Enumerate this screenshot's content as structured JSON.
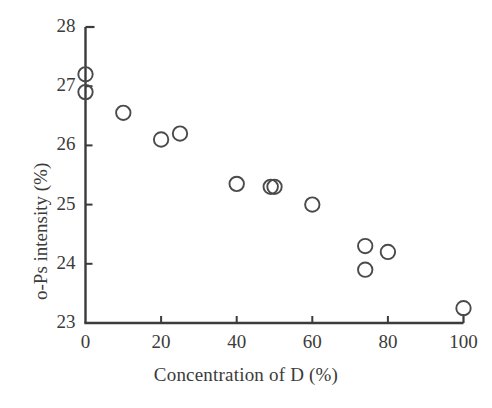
{
  "chart_data": {
    "type": "scatter",
    "title": "",
    "xlabel": "Concentration of D (%)",
    "ylabel": "o-Ps intensity (%)",
    "xlim": [
      0,
      100
    ],
    "ylim": [
      23,
      28
    ],
    "xticks": [
      0,
      20,
      40,
      60,
      80,
      100
    ],
    "xtick_labels": [
      "0",
      "20",
      "40",
      "60",
      "80",
      "100"
    ],
    "yticks": [
      23,
      24,
      25,
      26,
      27,
      28
    ],
    "ytick_labels": [
      "23",
      "24",
      "25",
      "26",
      "27",
      "28"
    ],
    "grid": false,
    "legend": null,
    "marker": "open-circle",
    "marker_color": "#4a4a4a",
    "points": [
      {
        "x": 0,
        "y": 27.2
      },
      {
        "x": 0,
        "y": 26.9
      },
      {
        "x": 10,
        "y": 26.55
      },
      {
        "x": 20,
        "y": 26.1
      },
      {
        "x": 25,
        "y": 26.2
      },
      {
        "x": 40,
        "y": 25.35
      },
      {
        "x": 49,
        "y": 25.3
      },
      {
        "x": 50,
        "y": 25.3
      },
      {
        "x": 60,
        "y": 25.0
      },
      {
        "x": 74,
        "y": 24.3
      },
      {
        "x": 80,
        "y": 24.2
      },
      {
        "x": 74,
        "y": 23.9
      },
      {
        "x": 100,
        "y": 23.25
      }
    ]
  },
  "axes": {
    "axis_color": "#3b3b3b",
    "axis_line_width": 2.4,
    "tick_length": 7
  },
  "xtick_labels": [
    "0",
    "20",
    "40",
    "60",
    "80",
    "100"
  ],
  "ytick_labels": [
    "23",
    "24",
    "25",
    "26",
    "27",
    "28"
  ]
}
